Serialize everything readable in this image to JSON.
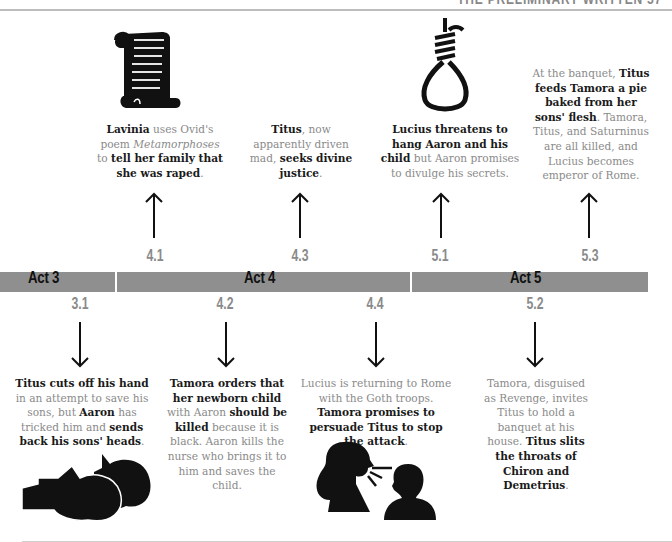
{
  "header": {
    "title": "THE PRELIMINARY WRITTEN   57"
  },
  "timeline": {
    "acts": [
      {
        "label": "Act 3"
      },
      {
        "label": "Act 4"
      },
      {
        "label": "Act 5"
      }
    ],
    "above": [
      {
        "scene": "4.1",
        "icon": "scroll-icon",
        "parts": [
          {
            "t": "Lavinia",
            "s": "b"
          },
          {
            "t": " uses Ovid's poem ",
            "s": "n"
          },
          {
            "t": "Metamorphoses",
            "s": "i"
          },
          {
            "t": " to ",
            "s": "n"
          },
          {
            "t": "tell her family that she was raped",
            "s": "b"
          },
          {
            "t": ".",
            "s": "n"
          }
        ]
      },
      {
        "scene": "4.3",
        "parts": [
          {
            "t": "Titus",
            "s": "b"
          },
          {
            "t": ", now apparently driven mad, ",
            "s": "n"
          },
          {
            "t": "seeks divine justice",
            "s": "b"
          },
          {
            "t": ".",
            "s": "n"
          }
        ]
      },
      {
        "scene": "5.1",
        "icon": "noose-icon",
        "parts": [
          {
            "t": "Lucius threatens to hang Aaron and his child",
            "s": "b"
          },
          {
            "t": " but Aaron promises to divulge his secrets.",
            "s": "n"
          }
        ]
      },
      {
        "scene": "5.3",
        "parts": [
          {
            "t": "At the banquet, ",
            "s": "n"
          },
          {
            "t": "Titus feeds Tamora a pie baked from her sons' flesh",
            "s": "b"
          },
          {
            "t": ". Tamora, Titus, and Saturninus are all killed, and Lucius becomes emperor of Rome.",
            "s": "n"
          }
        ]
      }
    ],
    "below": [
      {
        "scene": "3.1",
        "icon": "severed-heads-icon",
        "parts": [
          {
            "t": "Titus cuts off his hand",
            "s": "b"
          },
          {
            "t": " in an attempt to save his sons, but ",
            "s": "n"
          },
          {
            "t": "Aaron",
            "s": "b"
          },
          {
            "t": " has tricked him and ",
            "s": "n"
          },
          {
            "t": "sends back his sons' heads",
            "s": "b"
          },
          {
            "t": ".",
            "s": "n"
          }
        ]
      },
      {
        "scene": "4.2",
        "parts": [
          {
            "t": "Tamora orders that her newborn child",
            "s": "b"
          },
          {
            "t": " with Aaron ",
            "s": "n"
          },
          {
            "t": "should be killed",
            "s": "b"
          },
          {
            "t": " because it is black. Aaron kills the nurse who brings it to him and saves the child.",
            "s": "n"
          }
        ]
      },
      {
        "scene": "4.4",
        "icon": "speaking-heads-icon",
        "parts": [
          {
            "t": "Lucius is returning to Rome with the Goth troops. ",
            "s": "n"
          },
          {
            "t": "Tamora promises to persuade Titus to stop the attack",
            "s": "b"
          },
          {
            "t": ".",
            "s": "n"
          }
        ]
      },
      {
        "scene": "5.2",
        "parts": [
          {
            "t": "Tamora, disguised as Revenge, invites Titus to hold a banquet at his house. ",
            "s": "n"
          },
          {
            "t": "Titus slits the throats of Chiron and Demetrius",
            "s": "b"
          },
          {
            "t": ".",
            "s": "n"
          }
        ]
      }
    ]
  },
  "colors": {
    "bar": "#8f8f8f",
    "scene_number": "#8a8a8a",
    "caption_plain": "#8a8a8a",
    "caption_bold": "#1a1a1a"
  }
}
